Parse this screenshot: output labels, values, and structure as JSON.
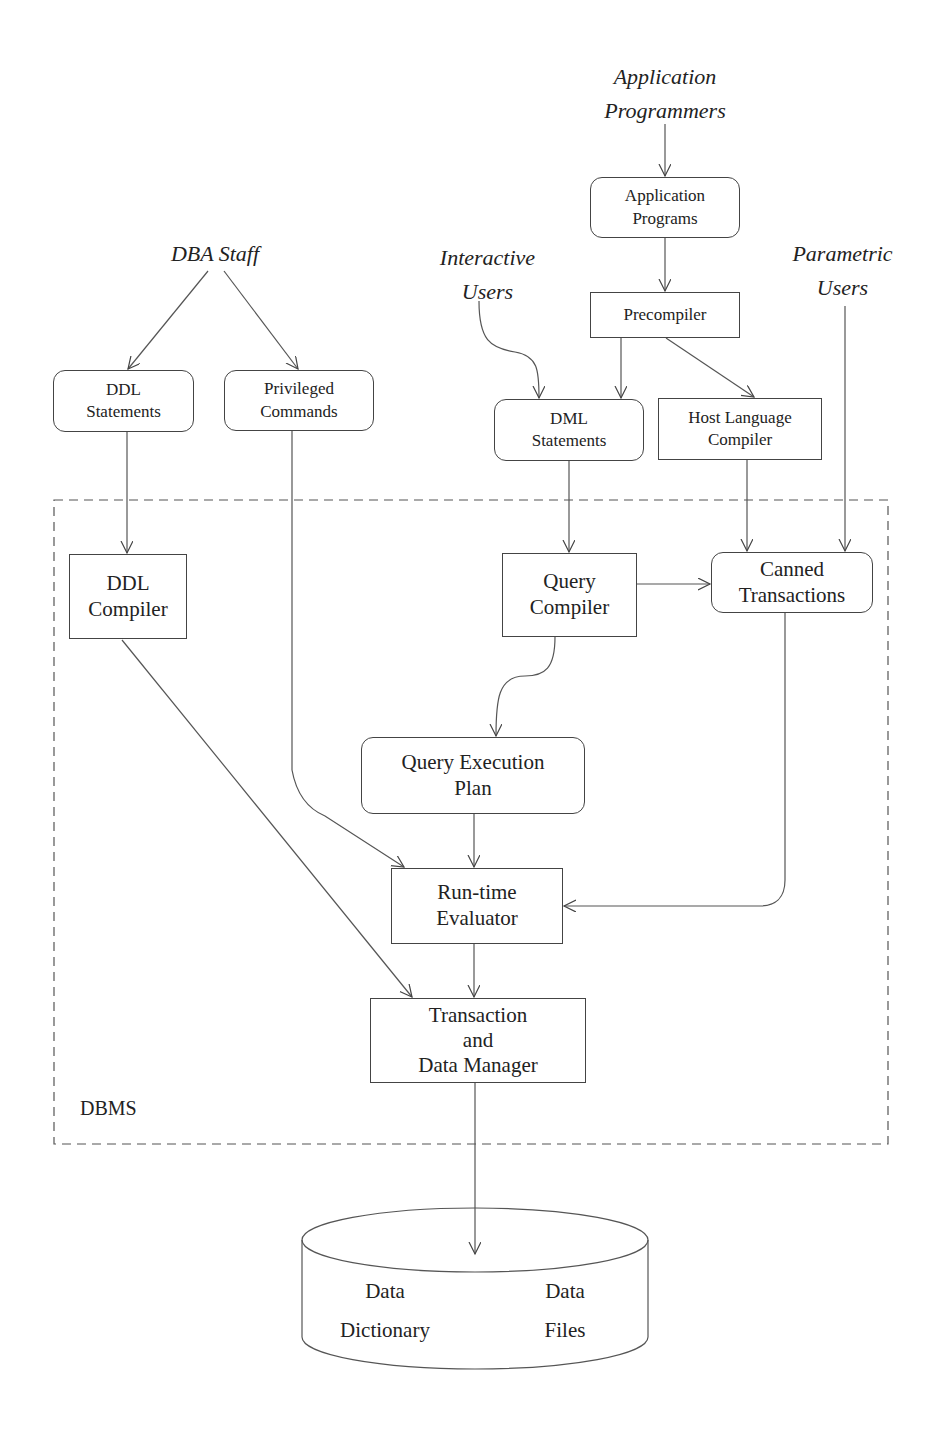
{
  "diagram": {
    "actors": {
      "app_programmers": [
        "Application",
        "Programmers"
      ],
      "dba_staff": [
        "DBA Staff"
      ],
      "interactive_users": [
        "Interactive",
        "Users"
      ],
      "parametric_users": [
        "Parametric",
        "Users"
      ]
    },
    "nodes": {
      "application_programs": [
        "Application",
        "Programs"
      ],
      "precompiler": [
        "Precompiler"
      ],
      "ddl_statements": [
        "DDL",
        "Statements"
      ],
      "privileged_commands": [
        "Privileged",
        "Commands"
      ],
      "dml_statements": [
        "DML",
        "Statements"
      ],
      "host_language_compiler": [
        "Host Language",
        "Compiler"
      ],
      "ddl_compiler": [
        "DDL",
        "Compiler"
      ],
      "query_compiler": [
        "Query",
        "Compiler"
      ],
      "canned_transactions": [
        "Canned",
        "Transactions"
      ],
      "query_execution_plan": [
        "Query Execution",
        "Plan"
      ],
      "runtime_evaluator": [
        "Run-time",
        "Evaluator"
      ],
      "transaction_data_manager": [
        "Transaction",
        "and",
        "Data Manager"
      ]
    },
    "boundary_label": "DBMS",
    "storage": {
      "data_dictionary": [
        "Data",
        "Dictionary"
      ],
      "data_files": [
        "Data",
        "Files"
      ]
    },
    "edges": [
      {
        "from": "Application Programmers",
        "to": "Application Programs"
      },
      {
        "from": "Application Programs",
        "to": "Precompiler"
      },
      {
        "from": "DBA Staff",
        "to": "DDL Statements"
      },
      {
        "from": "DBA Staff",
        "to": "Privileged Commands"
      },
      {
        "from": "Interactive Users",
        "to": "DML Statements"
      },
      {
        "from": "Precompiler",
        "to": "DML Statements"
      },
      {
        "from": "Precompiler",
        "to": "Host Language Compiler"
      },
      {
        "from": "DDL Statements",
        "to": "DDL Compiler"
      },
      {
        "from": "DML Statements",
        "to": "Query Compiler"
      },
      {
        "from": "Host Language Compiler",
        "to": "Canned Transactions"
      },
      {
        "from": "Parametric Users",
        "to": "Canned Transactions"
      },
      {
        "from": "Query Compiler",
        "to": "Canned Transactions"
      },
      {
        "from": "Query Compiler",
        "to": "Query Execution Plan"
      },
      {
        "from": "Privileged Commands",
        "to": "Run-time Evaluator"
      },
      {
        "from": "Query Execution Plan",
        "to": "Run-time Evaluator"
      },
      {
        "from": "Canned Transactions",
        "to": "Run-time Evaluator"
      },
      {
        "from": "DDL Compiler",
        "to": "Transaction and Data Manager"
      },
      {
        "from": "Run-time Evaluator",
        "to": "Transaction and Data Manager"
      },
      {
        "from": "Transaction and Data Manager",
        "to": "Stored Data"
      }
    ]
  }
}
